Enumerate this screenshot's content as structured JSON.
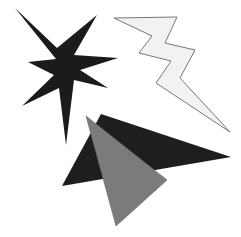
{
  "canvas": {
    "width": 241,
    "height": 237,
    "background": "#ffffff"
  },
  "shapes": {
    "star": {
      "label": "eight-point star",
      "fill": "#1c1a1d",
      "stroke": "none",
      "points": "15,8 57,48 97,15 74,55 118,58 80,70 108,88 74,80 66,145 59,88 22,106 54,75 28,62 56,59"
    },
    "lightning": {
      "label": "lightning bolt",
      "fill": "#f2f2f2",
      "stroke": "#777777",
      "points": "114,18 177,17 165,43 195,50 180,78 230,132 156,83 171,61 139,53 152,36"
    },
    "dark_triangle": {
      "label": "black triangle",
      "fill": "#1f1d20",
      "stroke": "none",
      "points": "101,114 231,157 62,186"
    },
    "gray_triangle": {
      "label": "gray triangle",
      "fill": "#7b7b7b",
      "stroke": "#666666",
      "points": "86,116 167,180 116,226"
    }
  }
}
